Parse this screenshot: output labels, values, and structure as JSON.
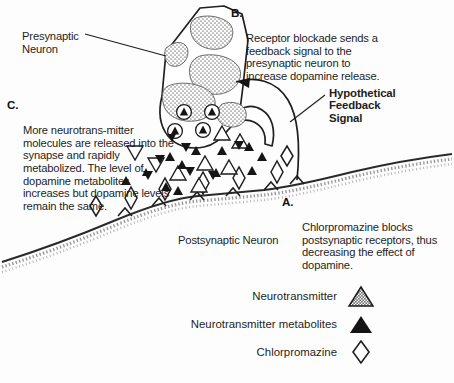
{
  "figure": {
    "type": "neuroscience-synapse-diagram",
    "labels": {
      "presynaptic_neuron": "Presynaptic\nNeuron",
      "postsynaptic_neuron": "Postsynaptic Neuron",
      "hypothetical_feedback_signal": "Hypothetical\nFeedback\nSignal"
    },
    "callouts": [
      {
        "id": "A",
        "letter": "A.",
        "text": "Chlorpromazine blocks postsynaptic receptors, thus decreasing the effect of dopamine."
      },
      {
        "id": "B",
        "letter": "B.",
        "text": "Receptor blockade sends a feedback signal to the presynaptic neuron to increase dopamine release."
      },
      {
        "id": "C",
        "letter": "C.",
        "text": "More neurotrans-mitter molecules are released into the synapse and rapidly metabolized. The level of dopamine metabolites increases but dopamine levels remain the same."
      }
    ],
    "legend": {
      "items": [
        {
          "label": "Neurotransmitter",
          "symbol": "gray-stippled-triangle-icon",
          "color": "#8c8c8c"
        },
        {
          "label": "Neurotransmitter metabolites",
          "symbol": "solid-black-triangle-icon",
          "color": "#111111"
        },
        {
          "label": "Chlorpromazine",
          "symbol": "open-diamond-icon",
          "color": "#ffffff"
        }
      ]
    },
    "colors": {
      "ink": "#1d1d1d",
      "membrane": "#2a2a2a",
      "mitochondria_fill": "#8f8f8f",
      "background": "#fdfdfd"
    }
  }
}
